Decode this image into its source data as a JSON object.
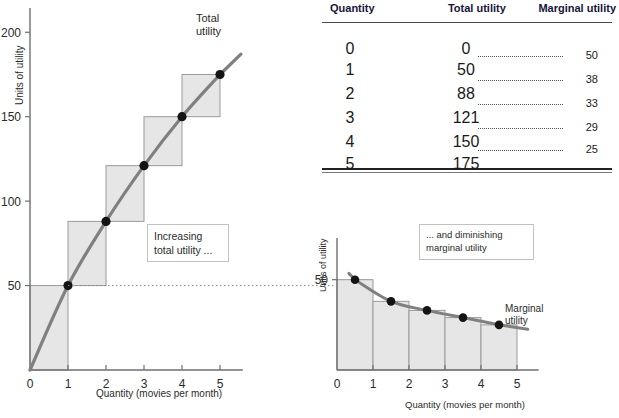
{
  "table": {
    "headers": [
      "Quantity",
      "Total utility",
      "Marginal utility"
    ],
    "rows": [
      {
        "quantity": "0",
        "total": "0",
        "marginal": ""
      },
      {
        "quantity": "1",
        "total": "50",
        "marginal": "50"
      },
      {
        "quantity": "2",
        "total": "88",
        "marginal": "38"
      },
      {
        "quantity": "3",
        "total": "121",
        "marginal": "33"
      },
      {
        "quantity": "4",
        "total": "150",
        "marginal": "29"
      },
      {
        "quantity": "5",
        "total": "175",
        "marginal": "25"
      }
    ]
  },
  "total_chart": {
    "curve_label": "Total\nutility",
    "callout": "Increasing\ntotal utility ...",
    "ylabel": "Units of utility",
    "xlabel": "Quantity (movies per month)",
    "yticks": [
      "50",
      "100",
      "150",
      "200"
    ],
    "xticks": [
      "0",
      "1",
      "2",
      "3",
      "4",
      "5"
    ]
  },
  "marginal_chart": {
    "curve_label": "Marginal\nutility",
    "callout": "... and diminishing\nmarginal utility",
    "ylabel": "Units of utility",
    "xlabel": "Quantity (movies per month)",
    "yticks": [
      "50"
    ],
    "xticks": [
      "0",
      "1",
      "2",
      "3",
      "4",
      "5"
    ]
  },
  "colors": {
    "curve": "#808080",
    "fill": "#e6e6e6",
    "box_stroke": "#9a9a9a",
    "axis": "#6f6f6f",
    "point": "#141414",
    "header_text": "#15153a"
  },
  "chart_data": [
    {
      "type": "line",
      "id": "total-utility",
      "title": "Total utility",
      "xlabel": "Quantity (movies per month)",
      "ylabel": "Units of utility",
      "x": [
        0,
        1,
        2,
        3,
        4,
        5
      ],
      "values": [
        0,
        50,
        88,
        121,
        150,
        175
      ],
      "xlim": [
        0,
        5.6
      ],
      "ylim": [
        0,
        212
      ],
      "xticks": [
        0,
        1,
        2,
        3,
        4,
        5
      ],
      "yticks": [
        50,
        100,
        150,
        200
      ],
      "grid": false,
      "legend": "none",
      "annotations": [
        "Total utility",
        "Increasing total utility ..."
      ],
      "step_boxes": [
        {
          "x0": 0,
          "x1": 1,
          "y0": 0,
          "y1": 50
        },
        {
          "x0": 1,
          "x1": 2,
          "y0": 50,
          "y1": 88
        },
        {
          "x0": 2,
          "x1": 3,
          "y0": 88,
          "y1": 121
        },
        {
          "x0": 3,
          "x1": 4,
          "y0": 121,
          "y1": 150
        },
        {
          "x0": 4,
          "x1": 5,
          "y0": 150,
          "y1": 175
        }
      ]
    },
    {
      "type": "bar",
      "id": "marginal-utility",
      "title": "Marginal utility",
      "xlabel": "Quantity (movies per month)",
      "ylabel": "Units of utility",
      "categories": [
        "0-1",
        "1-2",
        "2-3",
        "3-4",
        "4-5"
      ],
      "bar_centers": [
        0.5,
        1.5,
        2.5,
        3.5,
        4.5
      ],
      "values": [
        50,
        38,
        33,
        29,
        25
      ],
      "xlim": [
        0,
        5.6
      ],
      "ylim": [
        0,
        62
      ],
      "xticks": [
        0,
        1,
        2,
        3,
        4,
        5
      ],
      "yticks": [
        50
      ],
      "grid": false,
      "legend": "none",
      "annotations": [
        "Marginal utility",
        "... and diminishing marginal utility"
      ]
    }
  ]
}
